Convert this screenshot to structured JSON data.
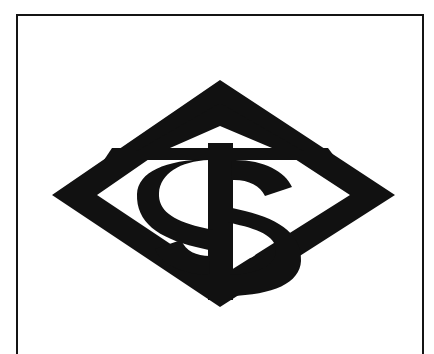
{
  "document": {
    "type": "trademark-specimen-scan",
    "background_color": "#ffffff",
    "page_width": 434,
    "page_height": 349
  },
  "frame": {
    "name": "border-rule",
    "stroke_color": "#141414",
    "stroke_width": 2,
    "left": 16,
    "top": 14,
    "width": 408,
    "height": 340,
    "bottom_open": true
  },
  "logo": {
    "name": "diamond-dollar-sign-logo",
    "description": "Bold diamond (rhombus) outline enclosing a dollar sign, with a horizontal bar across the upper portion forming a triangle above",
    "ink_color": "#111111",
    "paper_color": "#ffffff",
    "elements": [
      {
        "name": "diamond-outline",
        "shape": "rhombus"
      },
      {
        "name": "horizontal-crossbar",
        "shape": "bar"
      },
      {
        "name": "upper-triangle-counter",
        "shape": "triangle-void"
      },
      {
        "name": "dollar-sign",
        "glyph": "$"
      },
      {
        "name": "dollar-upper-counter-dot",
        "shape": "dot"
      },
      {
        "name": "dollar-lower-counter-dot",
        "shape": "dot"
      }
    ],
    "geometry": {
      "top_vertex_x": 220,
      "top_vertex_y": 82,
      "bottom_vertex_x": 220,
      "bottom_vertex_y": 305,
      "left_vertex_x": 53,
      "left_vertex_y": 195,
      "right_vertex_x": 393,
      "right_vertex_y": 195,
      "crossbar_y": 154,
      "stroke_weight": 26
    }
  }
}
